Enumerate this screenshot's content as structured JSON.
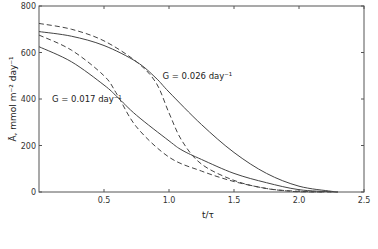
{
  "chart_data": {
    "type": "line",
    "title": "",
    "xlabel": "t/τ",
    "ylabel": "Ā, mmol m⁻² day⁻¹",
    "xlim": [
      0,
      2.5
    ],
    "ylim": [
      0,
      800
    ],
    "xticks": [
      "0.5",
      "1.0",
      "1.5",
      "2.0",
      "2.5"
    ],
    "yticks": [
      "0",
      "200",
      "400",
      "600",
      "800"
    ],
    "grid": false,
    "legend": null,
    "annotations": [
      {
        "text": "G = 0.026 day⁻¹",
        "x": 0.95,
        "y": 500
      },
      {
        "text": "G = 0.017 day⁻¹",
        "x": 0.1,
        "y": 400
      }
    ],
    "series": [
      {
        "name": "G = 0.026 day⁻¹ (solid)",
        "style": "solid",
        "x": [
          0,
          0.25,
          0.5,
          0.75,
          0.9,
          1.0,
          1.25,
          1.5,
          1.75,
          2.0,
          2.25,
          2.3
        ],
        "y": [
          690,
          670,
          630,
          560,
          490,
          430,
          290,
          170,
          80,
          25,
          3,
          0
        ]
      },
      {
        "name": "G = 0.026 day⁻¹ (dashed)",
        "style": "dashed",
        "x": [
          0,
          0.25,
          0.5,
          0.75,
          0.9,
          1.0,
          1.1,
          1.25,
          1.5,
          1.75,
          2.0,
          2.25
        ],
        "y": [
          725,
          700,
          650,
          560,
          470,
          340,
          220,
          120,
          50,
          15,
          3,
          0
        ]
      },
      {
        "name": "G = 0.017 day⁻¹ (solid)",
        "style": "solid",
        "x": [
          0,
          0.25,
          0.5,
          0.6,
          0.75,
          1.0,
          1.1,
          1.25,
          1.5,
          1.75,
          2.0,
          2.25,
          2.3
        ],
        "y": [
          625,
          560,
          460,
          410,
          330,
          220,
          180,
          140,
          80,
          40,
          10,
          1,
          0
        ]
      },
      {
        "name": "G = 0.017 day⁻¹ (dashed)",
        "style": "dashed",
        "x": [
          0,
          0.25,
          0.5,
          0.6,
          0.75,
          1.0,
          1.25,
          1.5,
          1.75,
          1.9,
          2.0,
          2.2
        ],
        "y": [
          675,
          610,
          500,
          420,
          280,
          150,
          90,
          45,
          15,
          5,
          1,
          0
        ]
      }
    ]
  }
}
